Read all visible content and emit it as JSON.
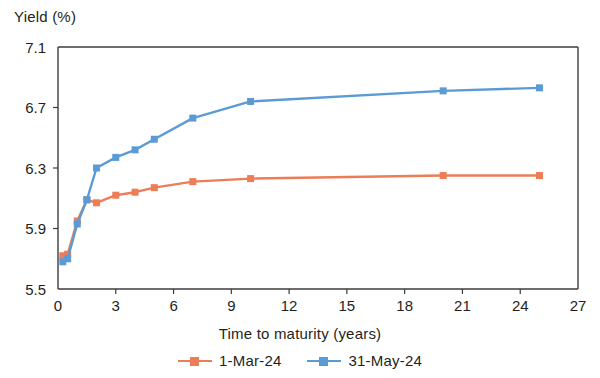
{
  "chart_data": {
    "type": "line",
    "title": "",
    "subtitle": "",
    "xlabel": "Time to maturity (years)",
    "ylabel": "Yield (%)",
    "xlim": [
      0,
      27
    ],
    "ylim": [
      5.5,
      7.1
    ],
    "xticks": [
      0,
      3,
      6,
      9,
      12,
      15,
      18,
      21,
      24,
      27
    ],
    "yticks": [
      5.5,
      5.9,
      6.3,
      6.7,
      7.1
    ],
    "xtick_labels": [
      "0",
      "3",
      "6",
      "9",
      "12",
      "15",
      "18",
      "21",
      "24",
      "27"
    ],
    "ytick_labels": [
      "5.5",
      "5.9",
      "6.3",
      "6.7",
      "7.1"
    ],
    "grid": false,
    "legend_position": "bottom",
    "marker": "square",
    "series": [
      {
        "name": "1-Mar-24",
        "color": "#ED7D57",
        "x": [
          0.25,
          0.5,
          1,
          1.5,
          2,
          3,
          4,
          5,
          7,
          10,
          20,
          25
        ],
        "values": [
          5.72,
          5.73,
          5.95,
          6.09,
          6.07,
          6.12,
          6.14,
          6.17,
          6.21,
          6.23,
          6.25,
          6.25
        ]
      },
      {
        "name": "31-May-24",
        "color": "#5B9BD5",
        "x": [
          0.25,
          0.5,
          1,
          1.5,
          2,
          3,
          4,
          5,
          7,
          10,
          20,
          25
        ],
        "values": [
          5.68,
          5.7,
          5.93,
          6.09,
          6.3,
          6.37,
          6.42,
          6.49,
          6.63,
          6.74,
          6.81,
          6.83
        ]
      }
    ]
  },
  "legend": {
    "items": [
      {
        "label": "1-Mar-24",
        "color": "#ED7D57"
      },
      {
        "label": "31-May-24",
        "color": "#5B9BD5"
      }
    ]
  }
}
